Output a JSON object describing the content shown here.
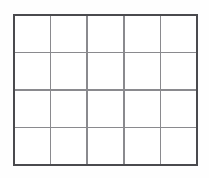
{
  "figure": {
    "name": "blank-grid-table",
    "background_color": "#fefefe"
  },
  "grid": {
    "columns": 5,
    "rows": 4,
    "total_cells": 20,
    "cell_fill_color": "#ffffff",
    "border_color": "#4a4a4e",
    "border_width_px": 2,
    "gridline_color": "#8a8a8e",
    "gridline_width_px": 1.5,
    "bounds": {
      "x": 13,
      "y": 14,
      "width": 185,
      "height": 152
    },
    "column_x_positions": [
      13,
      50,
      87,
      124,
      161,
      198
    ],
    "row_y_positions": [
      14,
      52,
      90,
      128,
      166
    ],
    "cells": [
      {
        "row": 1,
        "col": 1,
        "text": ""
      },
      {
        "row": 1,
        "col": 2,
        "text": ""
      },
      {
        "row": 1,
        "col": 3,
        "text": ""
      },
      {
        "row": 1,
        "col": 4,
        "text": ""
      },
      {
        "row": 1,
        "col": 5,
        "text": ""
      },
      {
        "row": 2,
        "col": 1,
        "text": ""
      },
      {
        "row": 2,
        "col": 2,
        "text": ""
      },
      {
        "row": 2,
        "col": 3,
        "text": ""
      },
      {
        "row": 2,
        "col": 4,
        "text": ""
      },
      {
        "row": 2,
        "col": 5,
        "text": ""
      },
      {
        "row": 3,
        "col": 1,
        "text": ""
      },
      {
        "row": 3,
        "col": 2,
        "text": ""
      },
      {
        "row": 3,
        "col": 3,
        "text": ""
      },
      {
        "row": 3,
        "col": 4,
        "text": ""
      },
      {
        "row": 3,
        "col": 5,
        "text": ""
      },
      {
        "row": 4,
        "col": 1,
        "text": ""
      },
      {
        "row": 4,
        "col": 2,
        "text": ""
      },
      {
        "row": 4,
        "col": 3,
        "text": ""
      },
      {
        "row": 4,
        "col": 4,
        "text": ""
      },
      {
        "row": 4,
        "col": 5,
        "text": ""
      }
    ]
  }
}
